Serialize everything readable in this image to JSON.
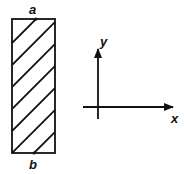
{
  "diagram": {
    "rect": {
      "top_label": "a",
      "bottom_label": "b",
      "hatch": "diagonal"
    },
    "axes": {
      "x_label": "x",
      "y_label": "y"
    },
    "stroke_color": "#111111",
    "background_color": "#ffffff"
  }
}
